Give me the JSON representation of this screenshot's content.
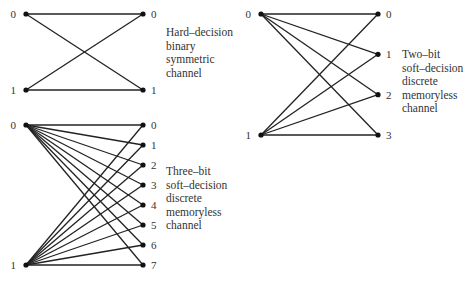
{
  "diagrams": [
    {
      "id": "hard",
      "caption": [
        "Hard–decision",
        "binary",
        "symmetric",
        "channel"
      ],
      "inputs": [
        "0",
        "1"
      ],
      "outputs": [
        "0",
        "1"
      ]
    },
    {
      "id": "two-bit",
      "caption": [
        "Two–bit",
        "soft–decision",
        "discrete",
        "memoryless",
        "channel"
      ],
      "inputs": [
        "0",
        "1"
      ],
      "outputs": [
        "0",
        "1",
        "2",
        "3"
      ]
    },
    {
      "id": "three-bit",
      "caption": [
        "Three–bit",
        "soft–decision",
        "discrete",
        "memoryless",
        "channel"
      ],
      "inputs": [
        "0",
        "1"
      ],
      "outputs": [
        "0",
        "1",
        "2",
        "3",
        "4",
        "5",
        "6",
        "7"
      ]
    }
  ],
  "colors": {
    "line": "#222222",
    "node": "#111111",
    "text": "#333333"
  }
}
